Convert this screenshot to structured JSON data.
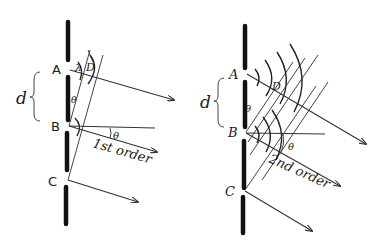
{
  "figure": {
    "colors": {
      "ink": "#111111",
      "background": "#ffffff"
    },
    "left_panel": {
      "slit_labels": [
        "A",
        "B",
        "C"
      ],
      "spacing_label": "d",
      "wavelength_label": "λ",
      "path_difference_label": "D",
      "angle_label_wedge": "θ",
      "angle_label_ray": "θ",
      "order_label": "1st order"
    },
    "right_panel": {
      "slit_labels": [
        "A",
        "B",
        "C"
      ],
      "spacing_label": "d",
      "path_difference_label": "D",
      "angle_label_wedge": "θ",
      "angle_label_ray": "θ",
      "order_label": "2nd order"
    }
  }
}
